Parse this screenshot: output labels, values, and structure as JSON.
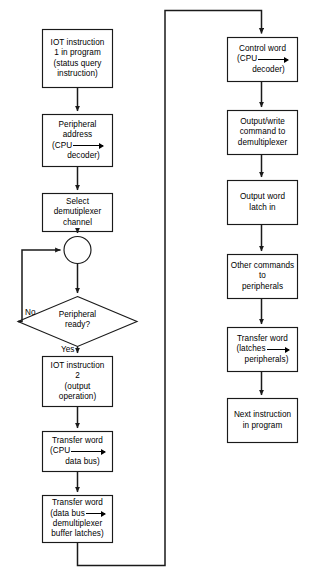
{
  "diagram": {
    "type": "flowchart",
    "canvas": {
      "width": 309,
      "height": 575
    },
    "stroke_color": "#1a1a1a",
    "text_color": "#000000",
    "background": "#ffffff"
  },
  "nodes": {
    "iot1": {
      "shape": "process",
      "lines": [
        "IOT instruction",
        "1 in program",
        "(status query",
        "instruction)"
      ]
    },
    "peripheral_address": {
      "shape": "process",
      "lines": [
        "Peripheral",
        "address"
      ],
      "arrow_from": "(CPU",
      "arrow_to": "decoder)"
    },
    "select_demux": {
      "shape": "process",
      "lines": [
        "Select",
        "demutiplexer",
        "channel"
      ]
    },
    "junction": {
      "shape": "connector",
      "lines": []
    },
    "peripheral_ready": {
      "shape": "decision",
      "lines": [
        "Peripheral",
        "ready?"
      ]
    },
    "iot2": {
      "shape": "process",
      "lines": [
        "IOT instruction",
        "2",
        "(output",
        "operation)"
      ]
    },
    "transfer_word_cpu": {
      "shape": "process",
      "lines": [
        "Transfer word"
      ],
      "arrow_from": "(CPU",
      "arrow_to": "data bus)"
    },
    "transfer_word_databus": {
      "shape": "process",
      "lines": [
        "Transfer word"
      ],
      "arrow_from": "(data bus",
      "arrow_to": "demultiplexer",
      "extra_line": "buffer latches)"
    },
    "control_word": {
      "shape": "process",
      "lines": [
        "Control word"
      ],
      "arrow_from": "(CPU",
      "arrow_to": "decoder)"
    },
    "output_write": {
      "shape": "process",
      "lines": [
        "Output/write",
        "command to",
        "demultiplexer"
      ]
    },
    "output_latch": {
      "shape": "process",
      "lines": [
        "Output word",
        "latch in"
      ]
    },
    "other_commands": {
      "shape": "process",
      "lines": [
        "Other commands",
        "to",
        "peripherals"
      ]
    },
    "transfer_word_latches": {
      "shape": "process",
      "lines": [
        "Transfer word"
      ],
      "arrow_from": "(latches",
      "arrow_to": "peripherals)"
    },
    "next_instruction": {
      "shape": "process",
      "lines": [
        "Next instruction",
        "in program"
      ]
    }
  },
  "edge_labels": {
    "no": "No",
    "yes": "Yes"
  }
}
